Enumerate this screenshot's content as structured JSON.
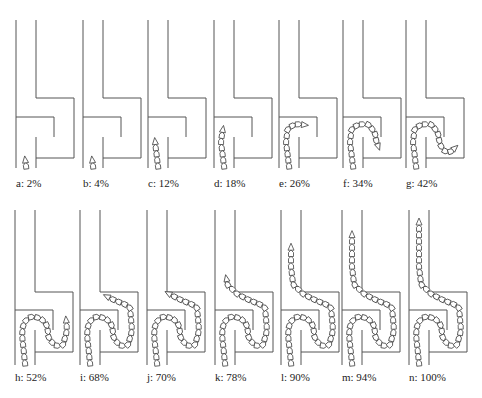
{
  "figure": {
    "stroke_color": "#555555",
    "segment_fill": "#ffffff",
    "panels": [
      {
        "id": "a",
        "label": "a: 2%",
        "progress": 2,
        "row": 0,
        "x0": 16
      },
      {
        "id": "b",
        "label": "b: 4%",
        "progress": 4,
        "row": 0,
        "x0": 83
      },
      {
        "id": "c",
        "label": "c: 12%",
        "progress": 12,
        "row": 0,
        "x0": 148
      },
      {
        "id": "d",
        "label": "d: 18%",
        "progress": 18,
        "row": 0,
        "x0": 214
      },
      {
        "id": "e",
        "label": "e: 26%",
        "progress": 26,
        "row": 0,
        "x0": 279
      },
      {
        "id": "f",
        "label": "f: 34%",
        "progress": 34,
        "row": 0,
        "x0": 343
      },
      {
        "id": "g",
        "label": "g: 42%",
        "progress": 42,
        "row": 0,
        "x0": 406
      },
      {
        "id": "h",
        "label": "h: 52%",
        "progress": 52,
        "row": 1,
        "x0": 15
      },
      {
        "id": "i",
        "label": "i: 68%",
        "progress": 68,
        "row": 1,
        "x0": 80
      },
      {
        "id": "j",
        "label": "j: 70%",
        "progress": 70,
        "row": 1,
        "x0": 147
      },
      {
        "id": "k",
        "label": "k: 78%",
        "progress": 78,
        "row": 1,
        "x0": 215
      },
      {
        "id": "l",
        "label": "l: 90%",
        "progress": 90,
        "row": 1,
        "x0": 281
      },
      {
        "id": "m",
        "label": "m: 94%",
        "progress": 94,
        "row": 1,
        "x0": 342
      },
      {
        "id": "n",
        "label": "n: 100%",
        "progress": 100,
        "row": 1,
        "x0": 409
      }
    ]
  }
}
